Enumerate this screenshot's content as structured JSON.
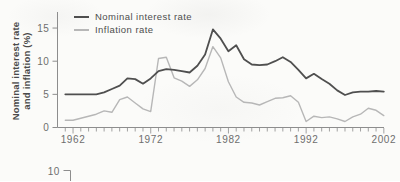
{
  "figure": {
    "y_axis_label_line1": "Nominal interest rate",
    "y_axis_label_line2": "and inflation (%)",
    "next_chart_fragment": {
      "tick_label": "10"
    }
  },
  "legend": [
    {
      "label": "Nominal interest rate",
      "color": "#4f4f4f"
    },
    {
      "label": "Inflation rate",
      "color": "#b7b7b7"
    }
  ],
  "chart_data": {
    "type": "line",
    "title": "",
    "xlabel": "",
    "ylabel": "Nominal interest rate and inflation (%)",
    "grid": false,
    "legend_position": "top-left",
    "ylim": [
      0,
      16.5
    ],
    "y_ticks": [
      0,
      5,
      10,
      15
    ],
    "x_tick_labels": [
      1962,
      1972,
      1982,
      1992,
      2002
    ],
    "x": [
      1961,
      1962,
      1963,
      1964,
      1965,
      1966,
      1967,
      1968,
      1969,
      1970,
      1971,
      1972,
      1973,
      1974,
      1975,
      1976,
      1977,
      1978,
      1979,
      1980,
      1981,
      1982,
      1983,
      1984,
      1985,
      1986,
      1987,
      1988,
      1989,
      1990,
      1991,
      1992,
      1993,
      1994,
      1995,
      1996,
      1997,
      1998,
      1999,
      2000,
      2001,
      2002
    ],
    "series": [
      {
        "name": "Nominal interest rate",
        "color": "#4f4f4f",
        "values": [
          5.0,
          5.0,
          5.0,
          5.0,
          5.0,
          5.3,
          5.8,
          6.3,
          7.4,
          7.3,
          6.6,
          7.4,
          8.5,
          8.8,
          8.7,
          8.5,
          8.3,
          9.3,
          11.0,
          14.8,
          13.4,
          11.5,
          12.4,
          10.3,
          9.5,
          9.4,
          9.5,
          10.0,
          10.6,
          9.9,
          8.7,
          7.4,
          8.1,
          7.3,
          6.6,
          5.6,
          4.9,
          5.3,
          5.4,
          5.4,
          5.5,
          5.4
        ]
      },
      {
        "name": "Inflation rate",
        "color": "#b7b7b7",
        "values": [
          1.1,
          1.1,
          1.4,
          1.7,
          2.0,
          2.5,
          2.3,
          4.2,
          4.6,
          3.7,
          2.8,
          2.4,
          10.4,
          10.6,
          7.5,
          7.0,
          6.2,
          7.2,
          8.9,
          12.2,
          10.5,
          6.9,
          4.6,
          3.8,
          3.7,
          3.4,
          3.9,
          4.4,
          4.5,
          4.8,
          3.8,
          0.9,
          1.7,
          1.5,
          1.6,
          1.3,
          0.9,
          1.6,
          2.0,
          2.9,
          2.6,
          1.8
        ]
      }
    ]
  }
}
